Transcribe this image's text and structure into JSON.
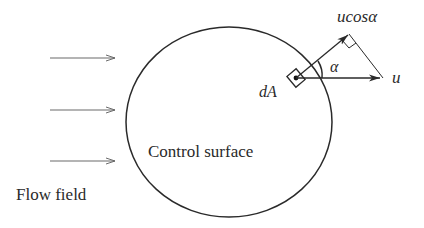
{
  "diagram": {
    "labels": {
      "flow_field": "Flow field",
      "control_surface": "Control surface",
      "element_area": "dA",
      "velocity": "u",
      "normal_component": "ucosα",
      "angle": "α"
    },
    "colors": {
      "stroke": "#2a2a2a",
      "flow_arrow": "#6a6a6a",
      "background": "#ffffff"
    },
    "flow_arrows_count": 3
  }
}
